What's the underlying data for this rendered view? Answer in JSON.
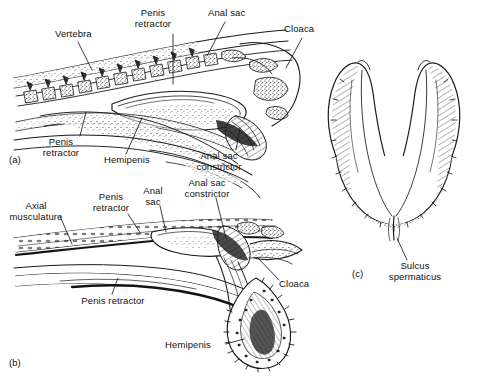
{
  "figure": {
    "background_color": "#ffffff",
    "ink_color": "#1a1a1a",
    "panels": [
      {
        "id": "a",
        "id_label": "(a)",
        "caption": "Sagittal section of tail base with retracted hemipenis"
      },
      {
        "id": "b",
        "id_label": "(b)",
        "caption": "Sagittal section with everted hemipenis"
      },
      {
        "id": "c",
        "id_label": "(c)",
        "caption": "Everted bilobed hemipenis, sulcate view"
      }
    ]
  },
  "panel_a": {
    "id_label": "(a)",
    "labels": [
      {
        "name": "vertebra",
        "text": "Vertebra",
        "x": 55,
        "y": 31,
        "align": "left"
      },
      {
        "name": "penis-retractor-top",
        "text": "Penis\nretractor",
        "x": 152,
        "y": 10,
        "align": "center"
      },
      {
        "name": "anal-sac",
        "text": "Anal sac",
        "x": 210,
        "y": 10,
        "align": "left"
      },
      {
        "name": "cloaca",
        "text": "Cloaca",
        "x": 285,
        "y": 26,
        "align": "left"
      },
      {
        "name": "penis-retractor-bottom",
        "text": "Penis\nretractor",
        "x": 58,
        "y": 139,
        "align": "center"
      },
      {
        "name": "hemipenis",
        "text": "Hemipenis",
        "x": 106,
        "y": 157,
        "align": "left"
      },
      {
        "name": "anal-sac-constrictor",
        "text": "Anal sac\nconstrictor",
        "x": 218,
        "y": 153,
        "align": "center"
      }
    ]
  },
  "panel_b": {
    "id_label": "(b)",
    "labels": [
      {
        "name": "axial-musculature",
        "text": "Axial\nmusculature",
        "x": 32,
        "y": 203,
        "align": "center"
      },
      {
        "name": "penis-retractor-top",
        "text": "Penis\nretractor",
        "x": 110,
        "y": 194,
        "align": "center"
      },
      {
        "name": "anal-sac",
        "text": "Anal\nsac",
        "x": 152,
        "y": 188,
        "align": "center"
      },
      {
        "name": "anal-sac-constrictor",
        "text": "Anal sac\nconstrictor",
        "x": 206,
        "y": 180,
        "align": "center"
      },
      {
        "name": "cloaca",
        "text": "Cloaca",
        "x": 280,
        "y": 283,
        "align": "left"
      },
      {
        "name": "penis-retractor-bottom",
        "text": "Penis retractor",
        "x": 112,
        "y": 298,
        "align": "center"
      },
      {
        "name": "hemipenis",
        "text": "Hemipenis",
        "x": 186,
        "y": 345,
        "align": "center"
      }
    ]
  },
  "panel_c": {
    "id_label": "(c)",
    "labels": [
      {
        "name": "sulcus-spermaticus",
        "text": "Sulcus\nspermaticus",
        "x": 415,
        "y": 263,
        "align": "center"
      }
    ]
  }
}
